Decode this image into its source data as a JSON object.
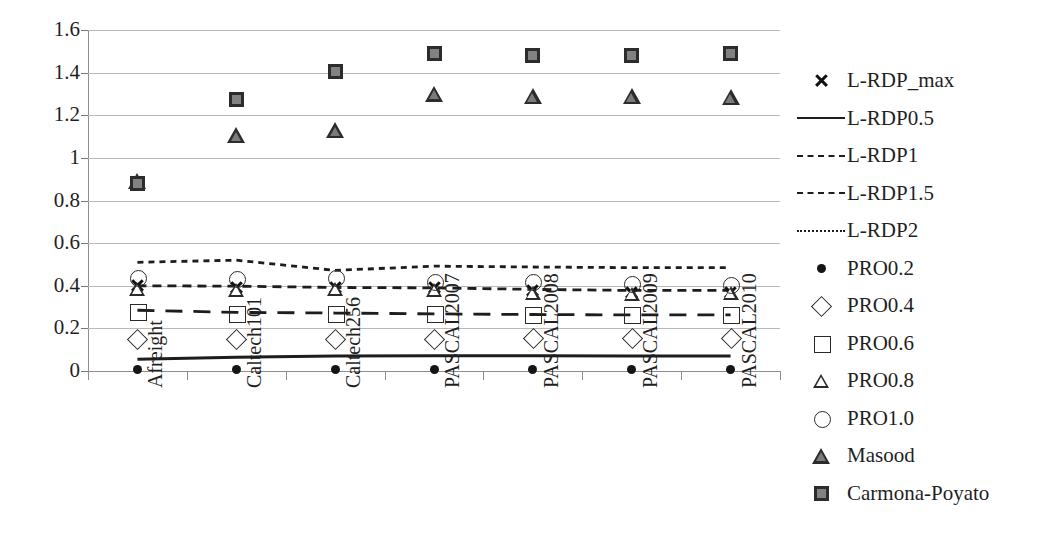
{
  "chart_data": {
    "type": "scatter",
    "title": "",
    "xlabel": "",
    "ylabel": "",
    "ylim": [
      0,
      1.6
    ],
    "ytick_labels": [
      "1.6",
      "1.4",
      "1.2",
      "1",
      "0.8",
      "0.6",
      "0.4",
      "0.2",
      "0"
    ],
    "ytick_values": [
      1.6,
      1.4,
      1.2,
      1.0,
      0.8,
      0.6,
      0.4,
      0.2,
      0
    ],
    "grid": true,
    "legend_position": "right",
    "categories": [
      "Afreight",
      "Caltech101",
      "Caltech256",
      "PASCAL2007",
      "PASCAL2008",
      "PASCAL2009",
      "PASCAL2010"
    ],
    "series": [
      {
        "name": "L-RDP_max",
        "marker": "x",
        "style": "markers",
        "values": [
          0.4,
          0.39,
          0.39,
          0.39,
          0.38,
          0.37,
          0.37
        ]
      },
      {
        "name": "L-RDP0.5",
        "marker": "none",
        "style": "line-solid",
        "values": [
          0.055,
          0.065,
          0.07,
          0.072,
          0.072,
          0.07,
          0.07
        ]
      },
      {
        "name": "L-RDP1",
        "marker": "none",
        "style": "line-dash-lg",
        "values": [
          0.285,
          0.275,
          0.272,
          0.268,
          0.265,
          0.263,
          0.263
        ]
      },
      {
        "name": "L-RDP1.5",
        "marker": "none",
        "style": "line-dash-md",
        "values": [
          0.4,
          0.398,
          0.392,
          0.39,
          0.383,
          0.378,
          0.378
        ]
      },
      {
        "name": "L-RDP2",
        "marker": "none",
        "style": "line-dash-sm",
        "values": [
          0.51,
          0.52,
          0.472,
          0.492,
          0.488,
          0.485,
          0.485
        ]
      },
      {
        "name": "PRO0.2",
        "marker": "filled-circle",
        "style": "markers",
        "values": [
          0.005,
          0.005,
          0.005,
          0.005,
          0.005,
          0.005,
          0.005
        ]
      },
      {
        "name": "PRO0.4",
        "marker": "open-diamond",
        "style": "markers",
        "values": [
          0.15,
          0.148,
          0.15,
          0.152,
          0.155,
          0.155,
          0.155
        ]
      },
      {
        "name": "PRO0.6",
        "marker": "open-square",
        "style": "markers",
        "values": [
          0.28,
          0.272,
          0.272,
          0.268,
          0.265,
          0.263,
          0.263
        ]
      },
      {
        "name": "PRO0.8",
        "marker": "open-triangle",
        "style": "markers",
        "values": [
          0.385,
          0.382,
          0.385,
          0.378,
          0.368,
          0.36,
          0.368
        ]
      },
      {
        "name": "PRO1.0",
        "marker": "open-circle",
        "style": "markers",
        "values": [
          0.44,
          0.432,
          0.44,
          0.422,
          0.418,
          0.412,
          0.408
        ]
      },
      {
        "name": "Masood",
        "marker": "filled-triangle",
        "style": "markers",
        "values": [
          0.89,
          1.105,
          1.13,
          1.3,
          1.288,
          1.288,
          1.285
        ]
      },
      {
        "name": "Carmona-Poyato",
        "marker": "filled-square",
        "style": "markers",
        "values": [
          0.88,
          1.272,
          1.405,
          1.492,
          1.482,
          1.48,
          1.49
        ]
      }
    ]
  },
  "legend": {
    "entries": [
      {
        "label": "L-RDP_max",
        "key": "x-marker"
      },
      {
        "label": "L-RDP0.5",
        "key": "solid-line"
      },
      {
        "label": "L-RDP1",
        "key": "long-dash-line"
      },
      {
        "label": "L-RDP1.5",
        "key": "medium-dash-line"
      },
      {
        "label": "L-RDP2",
        "key": "short-dash-line"
      },
      {
        "label": "PRO0.2",
        "key": "filled-circle-marker"
      },
      {
        "label": "PRO0.4",
        "key": "open-diamond-marker"
      },
      {
        "label": "PRO0.6",
        "key": "open-square-marker"
      },
      {
        "label": "PRO0.8",
        "key": "open-triangle-marker"
      },
      {
        "label": "PRO1.0",
        "key": "open-circle-marker"
      },
      {
        "label": "Masood",
        "key": "filled-triangle-marker"
      },
      {
        "label": "Carmona-Poyato",
        "key": "filled-square-marker"
      }
    ]
  },
  "colors": {
    "axis": "#8e8e8e",
    "grid": "#b9b9b9",
    "marker_stroke": "#2a2a2a",
    "marker_fill_dark": "#2c2c2c",
    "marker_fill_gray": "#828282",
    "line": "#1d1d1d",
    "text": "#1f1f1f",
    "background": "#ffffff"
  }
}
